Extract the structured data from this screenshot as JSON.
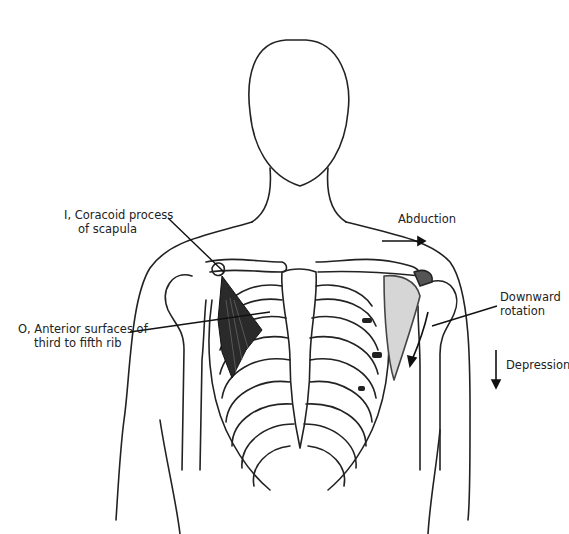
{
  "figure": {
    "labels": {
      "insertion_line1": "I, Coracoid process",
      "insertion_line2": "of scapula",
      "origin_line1": "O, Anterior surfaces of",
      "origin_line2": "third to fifth rib",
      "abduction": "Abduction",
      "downward_line1": "Downward",
      "downward_line2": "rotation",
      "depression": "Depression"
    },
    "colors": {
      "ink": "#222222",
      "muscle": "#2a2a2a",
      "shade": "#bdbdbd"
    }
  }
}
